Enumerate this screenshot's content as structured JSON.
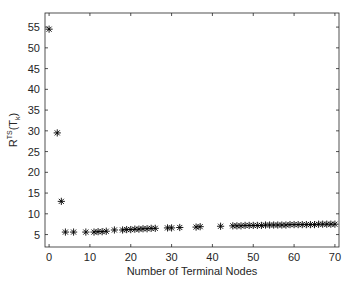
{
  "chart_data": {
    "type": "scatter",
    "title": "",
    "xlabel": "Number of Terminal Nodes",
    "ylabel": "R^TS(T_k)",
    "ylabel_parts": {
      "base": "R",
      "sup": "TS",
      "open": "(T",
      "sub": "k",
      "close": ")"
    },
    "xlim": [
      -1,
      71
    ],
    "ylim": [
      2,
      58.4
    ],
    "xticks": [
      0,
      10,
      20,
      30,
      40,
      50,
      60,
      70
    ],
    "yticks": [
      5,
      10,
      15,
      20,
      25,
      30,
      35,
      40,
      45,
      50,
      55
    ],
    "grid": false,
    "legend": null,
    "marker": "asterisk",
    "marker_color": "#000000",
    "series": [
      {
        "name": "R^TS(T_k)",
        "points": [
          [
            0,
            54.5
          ],
          [
            2,
            29.5
          ],
          [
            3,
            13.0
          ],
          [
            4,
            5.6
          ],
          [
            6,
            5.6
          ],
          [
            9,
            5.6
          ],
          [
            11,
            5.6
          ],
          [
            12,
            5.7
          ],
          [
            13,
            5.7
          ],
          [
            14,
            5.8
          ],
          [
            16,
            6.1
          ],
          [
            18,
            6.1
          ],
          [
            19,
            6.2
          ],
          [
            20,
            6.2
          ],
          [
            21,
            6.3
          ],
          [
            22,
            6.3
          ],
          [
            23,
            6.4
          ],
          [
            24,
            6.4
          ],
          [
            25,
            6.5
          ],
          [
            26,
            6.5
          ],
          [
            29,
            6.6
          ],
          [
            30,
            6.6
          ],
          [
            32,
            6.7
          ],
          [
            36,
            6.8
          ],
          [
            37,
            6.9
          ],
          [
            42,
            7.0
          ],
          [
            45,
            7.1
          ],
          [
            46,
            7.1
          ],
          [
            47,
            7.1
          ],
          [
            48,
            7.2
          ],
          [
            49,
            7.2
          ],
          [
            50,
            7.2
          ],
          [
            51,
            7.2
          ],
          [
            52,
            7.2
          ],
          [
            53,
            7.3
          ],
          [
            54,
            7.3
          ],
          [
            55,
            7.3
          ],
          [
            56,
            7.3
          ],
          [
            57,
            7.3
          ],
          [
            58,
            7.3
          ],
          [
            59,
            7.4
          ],
          [
            60,
            7.4
          ],
          [
            61,
            7.4
          ],
          [
            62,
            7.4
          ],
          [
            63,
            7.4
          ],
          [
            64,
            7.4
          ],
          [
            65,
            7.4
          ],
          [
            66,
            7.5
          ],
          [
            67,
            7.5
          ],
          [
            68,
            7.5
          ],
          [
            69,
            7.5
          ],
          [
            70,
            7.5
          ]
        ]
      }
    ]
  }
}
